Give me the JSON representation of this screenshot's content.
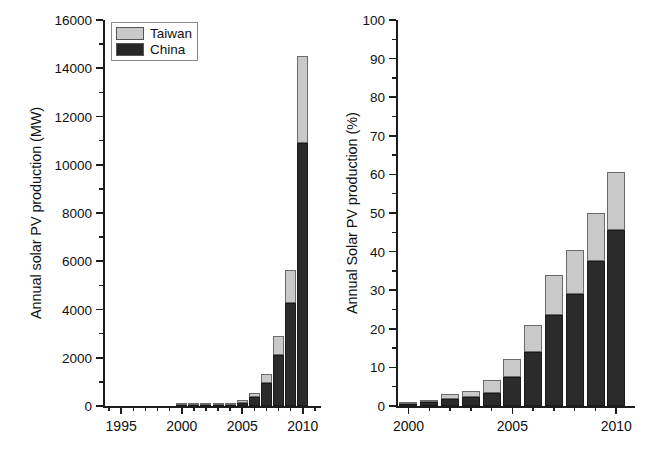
{
  "figure": {
    "background": "#ffffff",
    "colors": {
      "china": "#2b2b2b",
      "taiwan": "#c9c9c9",
      "axis": "#1d1d1d"
    }
  },
  "legend": {
    "items": [
      {
        "label": "Taiwan",
        "color": "#c9c9c9",
        "swatch": "taiwan-swatch"
      },
      {
        "label": "China",
        "color": "#2b2b2b",
        "swatch": "china-swatch"
      }
    ]
  },
  "chart_data": [
    {
      "id": "left",
      "type": "bar",
      "stacked": true,
      "title": "",
      "xlabel": "",
      "ylabel": "Annual solar PV production (MW)",
      "xlim": [
        1993.5,
        2011.5
      ],
      "ylim": [
        0,
        16000
      ],
      "ytick_labels": [
        "0",
        "2000",
        "4000",
        "6000",
        "8000",
        "10000",
        "12000",
        "14000",
        "16000"
      ],
      "yticks": [
        0,
        2000,
        4000,
        6000,
        8000,
        10000,
        12000,
        14000,
        16000
      ],
      "yminor_step": 1000,
      "xtick_labels": [
        "1995",
        "2000",
        "2005",
        "2010"
      ],
      "xticks": [
        1995,
        2000,
        2005,
        2010
      ],
      "xminor_step": 1,
      "grid": false,
      "legend_position": "top-left",
      "categories": [
        2000,
        2001,
        2002,
        2003,
        2004,
        2005,
        2006,
        2007,
        2008,
        2009,
        2010
      ],
      "series": [
        {
          "name": "China",
          "values": [
            3,
            5,
            10,
            22,
            60,
            128,
            370,
            950,
            2100,
            4280,
            10900
          ]
        },
        {
          "name": "Taiwan",
          "values": [
            1,
            2,
            4,
            8,
            22,
            110,
            180,
            390,
            790,
            1370,
            3600
          ]
        }
      ],
      "totals": [
        4,
        7,
        14,
        30,
        82,
        238,
        550,
        1340,
        2890,
        5650,
        14500
      ]
    },
    {
      "id": "right",
      "type": "bar",
      "stacked": true,
      "title": "",
      "xlabel": "",
      "ylabel": "Annual Solar PV production (%)",
      "xlim": [
        1999.4,
        2010.9
      ],
      "ylim": [
        0,
        100
      ],
      "ytick_labels": [
        "0",
        "10",
        "20",
        "30",
        "40",
        "50",
        "60",
        "70",
        "80",
        "90",
        "100"
      ],
      "yticks": [
        0,
        10,
        20,
        30,
        40,
        50,
        60,
        70,
        80,
        90,
        100
      ],
      "yminor_step": 5,
      "xtick_labels": [
        "2000",
        "2005",
        "2010"
      ],
      "xticks": [
        2000,
        2005,
        2010
      ],
      "xminor_step": 1,
      "grid": false,
      "categories": [
        2000,
        2001,
        2002,
        2003,
        2004,
        2005,
        2006,
        2007,
        2008,
        2009,
        2010
      ],
      "series": [
        {
          "name": "China",
          "values": [
            0.5,
            1.0,
            1.9,
            2.4,
            3.4,
            7.4,
            14.1,
            23.7,
            29.0,
            37.6,
            45.6
          ]
        },
        {
          "name": "Taiwan",
          "values": [
            0.2,
            0.6,
            1.1,
            1.6,
            3.4,
            4.8,
            6.9,
            10.2,
            11.3,
            12.4,
            14.9
          ]
        }
      ],
      "totals": [
        0.7,
        1.6,
        3.0,
        4.0,
        6.8,
        12.2,
        21.0,
        33.9,
        40.3,
        50.0,
        60.5
      ]
    }
  ]
}
